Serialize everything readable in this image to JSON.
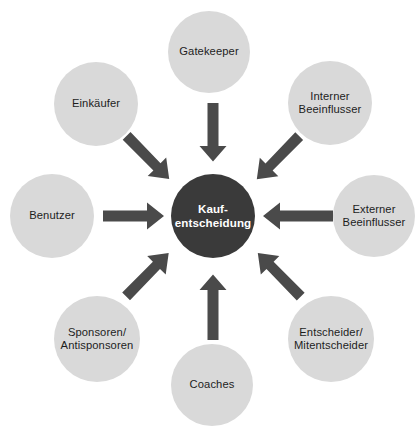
{
  "diagram": {
    "type": "hub-and-spoke",
    "background_color": "#ffffff",
    "center": {
      "id": "kaufentscheidung",
      "label": "Kauf-\nentscheidung",
      "label_line1": "Kauf-",
      "label_line2": "entscheidung",
      "fill_color": "#3a3a3a",
      "text_color": "#ffffff",
      "cx": 213,
      "cy": 216,
      "r": 42
    },
    "node_fill_color": "#d9d9d9",
    "node_text_color": "#1d1d1d",
    "arrow_color": "#4a4a4a",
    "nodes": [
      {
        "id": "gatekeeper",
        "label": "Gatekeeper",
        "position": "top",
        "cx": 209,
        "cy": 52,
        "r": 41
      },
      {
        "id": "interner-beeinflusser",
        "label": "Interner\nBeeinflusser",
        "position": "top-right",
        "cx": 330,
        "cy": 103,
        "r": 42
      },
      {
        "id": "externer-beeinflusser",
        "label": "Externer\nBeeinflusser",
        "position": "right",
        "cx": 374,
        "cy": 216,
        "r": 41
      },
      {
        "id": "entscheider-mitentscheider",
        "label": "Entscheider/\nMitentscheider",
        "position": "bottom-right",
        "cx": 331,
        "cy": 339,
        "r": 43
      },
      {
        "id": "coaches",
        "label": "Coaches",
        "position": "bottom",
        "cx": 212,
        "cy": 385,
        "r": 41
      },
      {
        "id": "sponsoren-antisponsoren",
        "label": "Sponsoren/\nAntisponsoren",
        "position": "bottom-left",
        "cx": 97,
        "cy": 339,
        "r": 43
      },
      {
        "id": "benutzer",
        "label": "Benutzer",
        "position": "left",
        "cx": 52,
        "cy": 216,
        "r": 42
      },
      {
        "id": "einkaeufer",
        "label": "Einkäufer",
        "position": "top-left",
        "cx": 96,
        "cy": 104,
        "r": 42
      }
    ],
    "arrows": [
      {
        "id": "arrow-gatekeeper",
        "from": "gatekeeper",
        "to": "kaufentscheidung",
        "direction": "down"
      },
      {
        "id": "arrow-interner-beeinflusser",
        "from": "interner-beeinflusser",
        "to": "kaufentscheidung",
        "direction": "down-left"
      },
      {
        "id": "arrow-externer-beeinflusser",
        "from": "externer-beeinflusser",
        "to": "kaufentscheidung",
        "direction": "left"
      },
      {
        "id": "arrow-entscheider",
        "from": "entscheider-mitentscheider",
        "to": "kaufentscheidung",
        "direction": "up-left"
      },
      {
        "id": "arrow-coaches",
        "from": "coaches",
        "to": "kaufentscheidung",
        "direction": "up"
      },
      {
        "id": "arrow-sponsoren",
        "from": "sponsoren-antisponsoren",
        "to": "kaufentscheidung",
        "direction": "up-right"
      },
      {
        "id": "arrow-benutzer",
        "from": "benutzer",
        "to": "kaufentscheidung",
        "direction": "right"
      },
      {
        "id": "arrow-einkaeufer",
        "from": "einkaeufer",
        "to": "kaufentscheidung",
        "direction": "down-right"
      }
    ]
  }
}
